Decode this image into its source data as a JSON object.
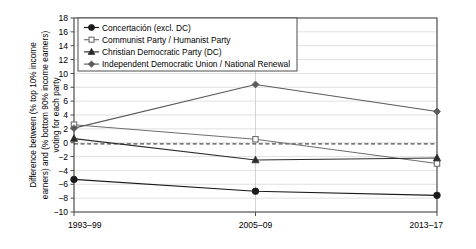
{
  "chart_data": {
    "type": "line",
    "title": "",
    "xlabel": "",
    "ylabel": "Difference between (% top 10% income earners) and (% bottom 90% income earners) voting for each party",
    "ylabel_lines": [
      "Difference between (% top 10% income",
      "earners) and (% bottom 90% income earners)",
      "voting for each party"
    ],
    "categories": [
      "1993–99",
      "2005–09",
      "2013–17"
    ],
    "ylim": [
      -10,
      18
    ],
    "ytick_labels": [
      "18",
      "16",
      "14",
      "12",
      "10",
      "8",
      "6",
      "4",
      "2",
      "0",
      "−2",
      "−4",
      "−6",
      "−8",
      "−10"
    ],
    "yticks": [
      18,
      16,
      14,
      12,
      10,
      8,
      6,
      4,
      2,
      0,
      -2,
      -4,
      -6,
      -8,
      -10
    ],
    "grid": true,
    "legend_position": "top-left",
    "zero_reference_line": 0,
    "series": [
      {
        "name": "Concertación (excl. DC)",
        "marker": "filled-circle",
        "color": "#1a1a1a",
        "values": [
          -5.3,
          -7.0,
          -7.6
        ]
      },
      {
        "name": "Communist Party / Humanist Party",
        "marker": "open-square",
        "color": "#6e6e6e",
        "values": [
          2.6,
          0.5,
          -3.0
        ]
      },
      {
        "name": "Christian Democratic Party (DC)",
        "marker": "filled-triangle",
        "color": "#2b2b2b",
        "values": [
          0.6,
          -2.5,
          -2.2
        ]
      },
      {
        "name": "Independent Democratic Union / National Renewal",
        "marker": "filled-diamond",
        "color": "#5a5a5a",
        "values": [
          2.1,
          8.4,
          4.5
        ]
      }
    ]
  }
}
